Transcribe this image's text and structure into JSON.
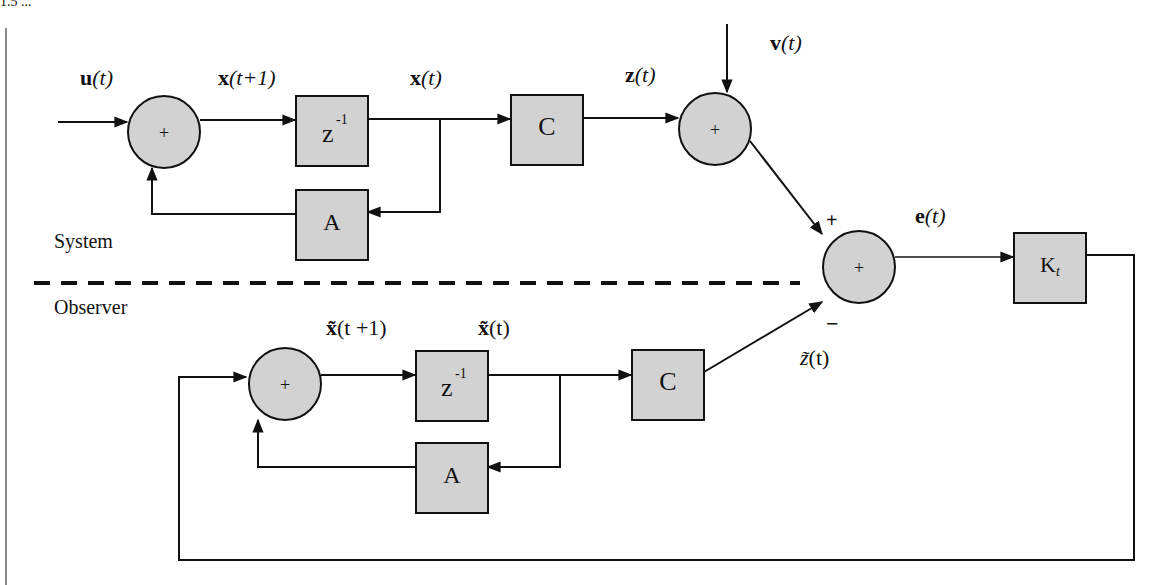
{
  "header_fragment": "1.5  ...",
  "regions": {
    "system_label": "System",
    "observer_label": "Observer"
  },
  "system": {
    "input_label_bold": "u",
    "input_label_arg": "(t)",
    "xnext_bold": "x",
    "xnext_arg": "(t+1)",
    "xt_bold": "x",
    "xt_arg": "(t)",
    "zt_bold": "z",
    "zt_arg": "(t)",
    "vt_bold": "v",
    "vt_arg": "(t)",
    "sum1_symbol": "+",
    "sum2_symbol": "+",
    "delay_block": "z",
    "delay_exp": "-1",
    "a_block": "A",
    "c_block": "C"
  },
  "error": {
    "sum_symbol": "+",
    "plus_sign": "+",
    "minus_sign": "−",
    "et_bold": "e",
    "et_arg": "(t)",
    "gain_block": "K",
    "gain_sub": "t"
  },
  "observer": {
    "xnext_bold": "x̃",
    "xnext_arg": "(t +1)",
    "xt_bold": "x̃",
    "xt_arg": "(t)",
    "zt_label": "z̃",
    "zt_arg": "(t)",
    "sum_symbol": "+",
    "delay_block": "z",
    "delay_exp": "-1",
    "a_block": "A",
    "c_block": "C"
  },
  "colors": {
    "block_fill": "#d2d2d2",
    "stroke": "#111111",
    "background": "#ffffff"
  }
}
